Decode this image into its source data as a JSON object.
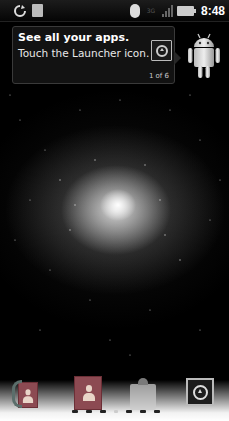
{
  "status_bar": {
    "left_icons": [
      "sync-icon",
      "usb-debugging-icon"
    ],
    "right_icons": [
      "bluetooth-icon",
      "3g-network-icon",
      "signal-strength-icon",
      "battery-charging-icon"
    ],
    "network_label": "3G",
    "time": "8:48"
  },
  "tooltip": {
    "title": "See all your apps.",
    "body": "Touch the Launcher icon.",
    "counter": "1 of 6",
    "icon": "launcher-icon"
  },
  "mascot": {
    "icon": "android-mascot"
  },
  "wallpaper": {
    "type": "galaxy",
    "description": "white starfield galaxy on black"
  },
  "dock": {
    "items": [
      {
        "name": "Phone",
        "icon": "phone-icon"
      },
      {
        "name": "Contacts",
        "icon": "contacts-icon"
      },
      {
        "name": "Messaging",
        "icon": "messaging-icon"
      },
      {
        "name": "Launcher",
        "icon": "launcher-icon"
      }
    ]
  },
  "page_indicator": {
    "total": 7,
    "current": 4
  },
  "colors": {
    "background": "#000000",
    "tooltip_bg": "#141414",
    "contact_card": "#8c4a52",
    "text": "#ffffff"
  }
}
